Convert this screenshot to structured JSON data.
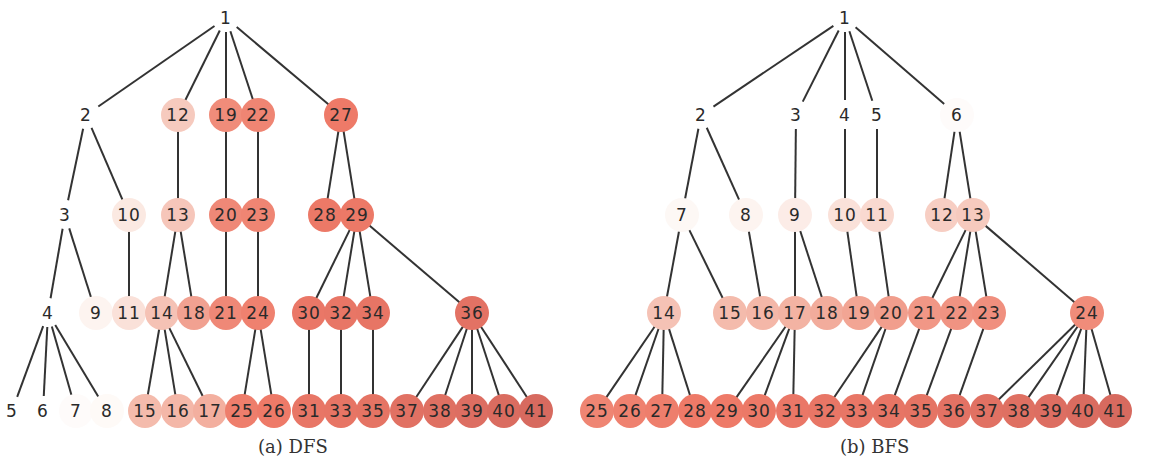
{
  "figure": {
    "node_radius": 17,
    "edge_color": "#333333",
    "color_scale": {
      "low": "#fdf6f2",
      "mid": "#f3b3a3",
      "high_a": "#ee7a68",
      "high_b": "#d4685e"
    },
    "level_y": [
      18,
      115,
      215,
      313,
      411
    ],
    "panels": [
      {
        "id": "dfs",
        "caption": "(a) DFS",
        "caption_x": 258,
        "nodes": [
          {
            "id": 1,
            "x": 226,
            "y": 18,
            "c": 0.0
          },
          {
            "id": 2,
            "x": 86,
            "y": 115,
            "c": 0.0
          },
          {
            "id": 12,
            "x": 178,
            "y": 115,
            "c": 0.28
          },
          {
            "id": 19,
            "x": 226,
            "y": 115,
            "c": 0.62
          },
          {
            "id": 22,
            "x": 258,
            "y": 115,
            "c": 0.66
          },
          {
            "id": 27,
            "x": 341,
            "y": 115,
            "c": 0.72
          },
          {
            "id": 3,
            "x": 65,
            "y": 215,
            "c": 0.0
          },
          {
            "id": 10,
            "x": 129,
            "y": 215,
            "c": 0.12
          },
          {
            "id": 13,
            "x": 178,
            "y": 215,
            "c": 0.3
          },
          {
            "id": 20,
            "x": 226,
            "y": 215,
            "c": 0.64
          },
          {
            "id": 23,
            "x": 258,
            "y": 215,
            "c": 0.66
          },
          {
            "id": 28,
            "x": 325,
            "y": 215,
            "c": 0.74
          },
          {
            "id": 29,
            "x": 357,
            "y": 215,
            "c": 0.74
          },
          {
            "id": 4,
            "x": 48,
            "y": 313,
            "c": 0.0
          },
          {
            "id": 9,
            "x": 96,
            "y": 313,
            "c": 0.06
          },
          {
            "id": 11,
            "x": 129,
            "y": 313,
            "c": 0.16
          },
          {
            "id": 14,
            "x": 162,
            "y": 313,
            "c": 0.32
          },
          {
            "id": 18,
            "x": 194,
            "y": 313,
            "c": 0.5
          },
          {
            "id": 21,
            "x": 226,
            "y": 313,
            "c": 0.64
          },
          {
            "id": 24,
            "x": 258,
            "y": 313,
            "c": 0.68
          },
          {
            "id": 30,
            "x": 309,
            "y": 313,
            "c": 0.76
          },
          {
            "id": 32,
            "x": 341,
            "y": 313,
            "c": 0.78
          },
          {
            "id": 34,
            "x": 373,
            "y": 313,
            "c": 0.8
          },
          {
            "id": 36,
            "x": 472,
            "y": 313,
            "c": 0.84
          },
          {
            "id": 5,
            "x": 12,
            "y": 411,
            "c": 0.0
          },
          {
            "id": 6,
            "x": 43,
            "y": 411,
            "c": 0.0
          },
          {
            "id": 7,
            "x": 76,
            "y": 411,
            "c": 0.02
          },
          {
            "id": 8,
            "x": 107,
            "y": 411,
            "c": 0.03
          },
          {
            "id": 15,
            "x": 145,
            "y": 411,
            "c": 0.36
          },
          {
            "id": 16,
            "x": 178,
            "y": 411,
            "c": 0.38
          },
          {
            "id": 17,
            "x": 210,
            "y": 411,
            "c": 0.42
          },
          {
            "id": 25,
            "x": 242,
            "y": 411,
            "c": 0.7
          },
          {
            "id": 26,
            "x": 274,
            "y": 411,
            "c": 0.72
          },
          {
            "id": 31,
            "x": 309,
            "y": 411,
            "c": 0.78
          },
          {
            "id": 33,
            "x": 341,
            "y": 411,
            "c": 0.8
          },
          {
            "id": 35,
            "x": 373,
            "y": 411,
            "c": 0.82
          },
          {
            "id": 37,
            "x": 407,
            "y": 411,
            "c": 0.86
          },
          {
            "id": 38,
            "x": 440,
            "y": 411,
            "c": 0.88
          },
          {
            "id": 39,
            "x": 472,
            "y": 411,
            "c": 0.9
          },
          {
            "id": 40,
            "x": 504,
            "y": 411,
            "c": 0.94
          },
          {
            "id": 41,
            "x": 536,
            "y": 411,
            "c": 0.97
          }
        ],
        "edges": [
          [
            1,
            2
          ],
          [
            1,
            12
          ],
          [
            1,
            19
          ],
          [
            1,
            22
          ],
          [
            1,
            27
          ],
          [
            2,
            3
          ],
          [
            2,
            10
          ],
          [
            12,
            13
          ],
          [
            19,
            20
          ],
          [
            22,
            23
          ],
          [
            27,
            28
          ],
          [
            27,
            29
          ],
          [
            3,
            4
          ],
          [
            3,
            9
          ],
          [
            10,
            11
          ],
          [
            13,
            14
          ],
          [
            13,
            18
          ],
          [
            20,
            21
          ],
          [
            23,
            24
          ],
          [
            29,
            30
          ],
          [
            29,
            32
          ],
          [
            29,
            34
          ],
          [
            29,
            36
          ],
          [
            4,
            5
          ],
          [
            4,
            6
          ],
          [
            4,
            7
          ],
          [
            4,
            8
          ],
          [
            14,
            15
          ],
          [
            14,
            16
          ],
          [
            14,
            17
          ],
          [
            24,
            25
          ],
          [
            24,
            26
          ],
          [
            30,
            31
          ],
          [
            32,
            33
          ],
          [
            34,
            35
          ],
          [
            36,
            37
          ],
          [
            36,
            38
          ],
          [
            36,
            39
          ],
          [
            36,
            40
          ],
          [
            36,
            41
          ]
        ]
      },
      {
        "id": "bfs",
        "caption": "(b) BFS",
        "caption_x": 840,
        "nodes": [
          {
            "id": 1,
            "x": 845,
            "y": 18,
            "c": 0.0
          },
          {
            "id": 2,
            "x": 701,
            "y": 115,
            "c": 0.0
          },
          {
            "id": 3,
            "x": 796,
            "y": 115,
            "c": 0.0
          },
          {
            "id": 4,
            "x": 845,
            "y": 115,
            "c": 0.0
          },
          {
            "id": 5,
            "x": 877,
            "y": 115,
            "c": 0.0
          },
          {
            "id": 6,
            "x": 957,
            "y": 115,
            "c": 0.02
          },
          {
            "id": 7,
            "x": 682,
            "y": 215,
            "c": 0.04
          },
          {
            "id": 8,
            "x": 746,
            "y": 215,
            "c": 0.06
          },
          {
            "id": 9,
            "x": 795,
            "y": 215,
            "c": 0.1
          },
          {
            "id": 10,
            "x": 845,
            "y": 215,
            "c": 0.16
          },
          {
            "id": 11,
            "x": 877,
            "y": 215,
            "c": 0.2
          },
          {
            "id": 12,
            "x": 942,
            "y": 215,
            "c": 0.26
          },
          {
            "id": 13,
            "x": 973,
            "y": 215,
            "c": 0.28
          },
          {
            "id": 14,
            "x": 664,
            "y": 313,
            "c": 0.32
          },
          {
            "id": 15,
            "x": 730,
            "y": 313,
            "c": 0.36
          },
          {
            "id": 16,
            "x": 763,
            "y": 313,
            "c": 0.38
          },
          {
            "id": 17,
            "x": 795,
            "y": 313,
            "c": 0.4
          },
          {
            "id": 18,
            "x": 827,
            "y": 313,
            "c": 0.44
          },
          {
            "id": 19,
            "x": 859,
            "y": 313,
            "c": 0.48
          },
          {
            "id": 20,
            "x": 891,
            "y": 313,
            "c": 0.52
          },
          {
            "id": 21,
            "x": 925,
            "y": 313,
            "c": 0.56
          },
          {
            "id": 22,
            "x": 957,
            "y": 313,
            "c": 0.58
          },
          {
            "id": 23,
            "x": 989,
            "y": 313,
            "c": 0.6
          },
          {
            "id": 24,
            "x": 1087,
            "y": 313,
            "c": 0.62
          },
          {
            "id": 25,
            "x": 597,
            "y": 411,
            "c": 0.66
          },
          {
            "id": 26,
            "x": 630,
            "y": 411,
            "c": 0.68
          },
          {
            "id": 27,
            "x": 662,
            "y": 411,
            "c": 0.7
          },
          {
            "id": 28,
            "x": 695,
            "y": 411,
            "c": 0.72
          },
          {
            "id": 29,
            "x": 727,
            "y": 411,
            "c": 0.72
          },
          {
            "id": 30,
            "x": 759,
            "y": 411,
            "c": 0.74
          },
          {
            "id": 31,
            "x": 793,
            "y": 411,
            "c": 0.76
          },
          {
            "id": 32,
            "x": 825,
            "y": 411,
            "c": 0.78
          },
          {
            "id": 33,
            "x": 857,
            "y": 411,
            "c": 0.78
          },
          {
            "id": 34,
            "x": 889,
            "y": 411,
            "c": 0.8
          },
          {
            "id": 35,
            "x": 921,
            "y": 411,
            "c": 0.82
          },
          {
            "id": 36,
            "x": 954,
            "y": 411,
            "c": 0.84
          },
          {
            "id": 37,
            "x": 987,
            "y": 411,
            "c": 0.86
          },
          {
            "id": 38,
            "x": 1019,
            "y": 411,
            "c": 0.88
          },
          {
            "id": 39,
            "x": 1051,
            "y": 411,
            "c": 0.9
          },
          {
            "id": 40,
            "x": 1083,
            "y": 411,
            "c": 0.94
          },
          {
            "id": 41,
            "x": 1115,
            "y": 411,
            "c": 0.97
          }
        ],
        "edges": [
          [
            1,
            2
          ],
          [
            1,
            3
          ],
          [
            1,
            4
          ],
          [
            1,
            5
          ],
          [
            1,
            6
          ],
          [
            2,
            7
          ],
          [
            2,
            8
          ],
          [
            3,
            9
          ],
          [
            4,
            10
          ],
          [
            5,
            11
          ],
          [
            6,
            12
          ],
          [
            6,
            13
          ],
          [
            7,
            14
          ],
          [
            7,
            15
          ],
          [
            8,
            16
          ],
          [
            9,
            17
          ],
          [
            9,
            18
          ],
          [
            10,
            19
          ],
          [
            11,
            20
          ],
          [
            13,
            21
          ],
          [
            13,
            22
          ],
          [
            13,
            23
          ],
          [
            13,
            24
          ],
          [
            14,
            25
          ],
          [
            14,
            26
          ],
          [
            14,
            27
          ],
          [
            14,
            28
          ],
          [
            17,
            29
          ],
          [
            17,
            30
          ],
          [
            17,
            31
          ],
          [
            20,
            32
          ],
          [
            20,
            33
          ],
          [
            21,
            34
          ],
          [
            22,
            35
          ],
          [
            23,
            36
          ],
          [
            24,
            37
          ],
          [
            24,
            38
          ],
          [
            24,
            39
          ],
          [
            24,
            40
          ],
          [
            24,
            41
          ]
        ]
      }
    ]
  }
}
